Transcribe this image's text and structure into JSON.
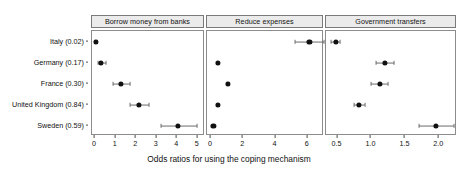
{
  "chart_data": {
    "type": "scatter",
    "title": "",
    "xlabel": "Odds ratios for using the coping mechanism",
    "ylabel": "",
    "grid": false,
    "legend": false,
    "orientation": "horizontal",
    "marker": "point-with-error-bars",
    "categories": [
      "Italy (0.02)",
      "Germany (0.17)",
      "France (0.30)",
      "United Kingdom (0.84)",
      "Sweden (0.59)"
    ],
    "facets": [
      {
        "label": "Borrow money from banks",
        "xlim": [
          -0.15,
          5.35
        ],
        "xticks": [
          0,
          1,
          2,
          3,
          4,
          5
        ],
        "xticklabels": [
          "0",
          "1",
          "2",
          "3",
          "4",
          "5"
        ],
        "values": [
          0.05,
          0.3,
          1.25,
          2.15,
          4.05
        ],
        "ci_low": [
          0.02,
          0.12,
          0.85,
          1.7,
          3.2
        ],
        "ci_high": [
          0.1,
          0.52,
          1.7,
          2.62,
          4.95
        ]
      },
      {
        "label": "Reduce expenses",
        "xlim": [
          -0.25,
          7.0
        ],
        "xticks": [
          0,
          2,
          4,
          6
        ],
        "xticklabels": [
          "0",
          "2",
          "4",
          "6"
        ],
        "values": [
          6.1,
          0.45,
          1.05,
          0.42,
          0.15
        ],
        "ci_low": [
          5.2,
          0.42,
          1.0,
          0.4,
          0.13
        ],
        "ci_high": [
          7.0,
          0.49,
          1.11,
          0.45,
          0.18
        ]
      },
      {
        "label": "Government transfers",
        "xlim": [
          0.33,
          2.26
        ],
        "xticks": [
          0.5,
          1.0,
          1.5,
          2.0
        ],
        "xticklabels": [
          "0.5",
          "1.0",
          "1.5",
          "2.0"
        ],
        "values": [
          0.47,
          1.2,
          1.12,
          0.82,
          1.95
        ],
        "ci_low": [
          0.41,
          1.07,
          1.0,
          0.74,
          1.7
        ],
        "ci_high": [
          0.54,
          1.33,
          1.25,
          0.91,
          2.22
        ]
      }
    ]
  },
  "colors": {
    "point": "#111111",
    "error_bar": "#6b6b6b",
    "strip_background": "#ebebeb",
    "panel_border": "#8c8c8c",
    "text": "#111111",
    "background": "#ffffff"
  }
}
